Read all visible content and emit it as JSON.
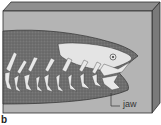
{
  "figure": {
    "panel_label": "b",
    "labels": {
      "jaw": "jaw"
    },
    "colors": {
      "block_front": "#b4b4b4",
      "block_top": "#8e8e8e",
      "block_side": "#7a7a7a",
      "fish_body": "#6e6e6e",
      "bones": "#e6e6e6",
      "outline": "#2e2e2e"
    }
  }
}
